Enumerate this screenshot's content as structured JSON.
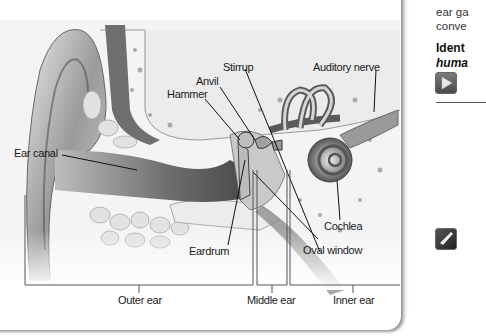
{
  "diagram": {
    "labels": {
      "ear_canal": "Ear canal",
      "hammer": "Hammer",
      "anvil": "Anvil",
      "stirrup": "Stirrup",
      "auditory_nerve": "Auditory nerve",
      "cochlea": "Cochlea",
      "eardrum": "Eardrum",
      "oval_window": "Oval window"
    },
    "regions": {
      "outer": "Outer ear",
      "middle": "Middle ear",
      "inner": "Inner ear"
    }
  },
  "sidebar": {
    "line1": "ear ga",
    "line2": "conve",
    "heading1": "Ident",
    "heading2": "huma",
    "play_button_icon": "play-icon",
    "tool_button_icon": "highlighter-icon",
    "colors": {
      "button_bg": "#555555",
      "button_dark": "#2e2e2e"
    }
  }
}
